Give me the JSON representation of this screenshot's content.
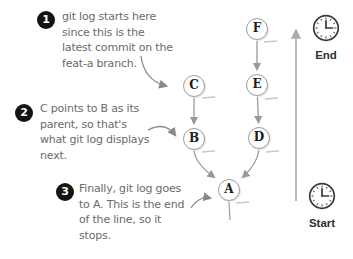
{
  "annotations": [
    {
      "number": "1",
      "text": "git log starts here\nsince this is the\nlatest commit on the\nfeat-a branch."
    },
    {
      "number": "2",
      "text": "C points to B as its\nparent, so that's\nwhat git log displays\nnext."
    },
    {
      "number": "3",
      "text": "Finally, git log goes\nto A. This is the end\nof the line, so it\nstops."
    }
  ],
  "graph": {
    "nodes": [
      {
        "id": "A",
        "label": "A"
      },
      {
        "id": "B",
        "label": "B"
      },
      {
        "id": "C",
        "label": "C"
      },
      {
        "id": "D",
        "label": "D"
      },
      {
        "id": "E",
        "label": "E"
      },
      {
        "id": "F",
        "label": "F"
      }
    ],
    "edges": [
      {
        "from": "F",
        "to": "E"
      },
      {
        "from": "E",
        "to": "D"
      },
      {
        "from": "C",
        "to": "B"
      },
      {
        "from": "B",
        "to": "A"
      },
      {
        "from": "D",
        "to": "A"
      }
    ]
  },
  "timeline": {
    "direction": "up",
    "end_label": "End",
    "start_label": "Start"
  },
  "icons": {
    "end_clock": "clock-icon",
    "start_clock": "clock-icon",
    "timeline_arrow": "arrow-up-icon"
  },
  "colors": {
    "background": "#ffffff",
    "badge": "#141414",
    "handwriting": "#6a6a6a",
    "node_outline": "#9e9e9e",
    "node_letter": "#1c1c1c",
    "edge_arrow": "#999999",
    "timeline_arrow": "#ababab",
    "clock": "#3a3a3a",
    "shade_dash": "#c8c8c8"
  }
}
